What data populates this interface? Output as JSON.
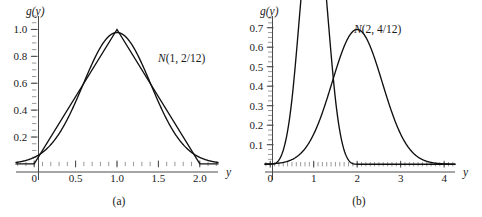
{
  "figure": {
    "background_color": "#ffffff",
    "ink_color": "#101010",
    "axis_color": "#4a4a4a",
    "panels": [
      "a",
      "b"
    ]
  },
  "chart_data": [
    {
      "type": "line",
      "panel": "a",
      "caption": "(a)",
      "title": "",
      "xlabel": "y",
      "ylabel": "g(y)",
      "grid": false,
      "legend": "none",
      "xlim": [
        -0.22,
        2.22
      ],
      "ylim": [
        -0.06,
        1.1
      ],
      "xticks": [
        0,
        0.5,
        1.0,
        1.5,
        2.0
      ],
      "xtick_labels": [
        "0",
        "0.5",
        "1.0",
        "1.5",
        "2.0"
      ],
      "yticks": [
        0.2,
        0.4,
        0.6,
        0.8,
        1.0
      ],
      "ytick_labels": [
        "0.2",
        "0.4",
        "0.6",
        "0.8",
        "1.0"
      ],
      "x_minor_tick_step": 0.1,
      "y_minor_tick_step": 0.05,
      "annotations": [
        {
          "text": "N(1, 2/12)",
          "italic_prefix": "N",
          "rest": "(1, 2/12)",
          "x": 1.47,
          "y": 0.83
        }
      ],
      "series": [
        {
          "name": "triangular density g(y)",
          "kind": "piecewise-linear",
          "x": [
            -0.22,
            0.0,
            1.0,
            2.0,
            2.22
          ],
          "values": [
            0.0,
            0.0,
            1.0,
            0.0,
            0.0
          ]
        },
        {
          "name": "N(1, 2/12) normal approximation",
          "kind": "normal",
          "mean": 1.0,
          "variance": 0.1666666667,
          "peak": 0.9772,
          "x": [
            -0.22,
            -0.1,
            0.0,
            0.1,
            0.2,
            0.3,
            0.4,
            0.5,
            0.6,
            0.7,
            0.8,
            0.9,
            1.0,
            1.1,
            1.2,
            1.3,
            1.4,
            1.5,
            1.6,
            1.7,
            1.8,
            1.9,
            2.0,
            2.1,
            2.22
          ],
          "values": [
            0.015,
            0.037,
            0.081,
            0.158,
            0.275,
            0.429,
            0.601,
            0.759,
            0.878,
            0.951,
            0.977,
            0.951,
            0.878,
            0.759,
            0.601,
            0.429,
            0.275,
            0.158,
            0.081,
            0.037,
            0.015,
            0.006,
            0.002,
            0.001,
            0.0
          ]
        }
      ]
    },
    {
      "type": "line",
      "panel": "b",
      "caption": "(b)",
      "title": "",
      "xlabel": "y",
      "ylabel": "g(y)",
      "grid": false,
      "legend": "none",
      "xlim": [
        -0.12,
        4.25
      ],
      "ylim": [
        -0.04,
        0.76
      ],
      "xticks": [
        0,
        1,
        2,
        3,
        4
      ],
      "xtick_labels": [
        "0",
        "1",
        "2",
        "3",
        "4"
      ],
      "yticks": [
        0.1,
        0.2,
        0.3,
        0.4,
        0.5,
        0.6,
        0.7
      ],
      "ytick_labels": [
        "0.1",
        "0.2",
        "0.3",
        "0.4",
        "0.5",
        "0.6",
        "0.7"
      ],
      "x_minor_tick_step": 0.1,
      "y_minor_tick_step": 0.025,
      "annotations": [
        {
          "text": "N(2, 4/12)",
          "italic_prefix": "N",
          "rest": "(2, 4/12)",
          "x": 2.55,
          "y": 0.695
        }
      ],
      "series": [
        {
          "name": "sum-of-four-uniforms density g(y)",
          "kind": "irwin-hall",
          "peak": 0.6905,
          "x": [
            0.0,
            0.2,
            0.4,
            0.6,
            0.8,
            1.0,
            1.2,
            1.4,
            1.6,
            1.8,
            2.0,
            2.2,
            2.4,
            2.6,
            2.8,
            3.0,
            3.2,
            3.4,
            3.6,
            3.8,
            4.0
          ],
          "values": [
            0.0,
            0.0013,
            0.0107,
            0.036,
            0.0853,
            0.1667,
            0.2827,
            0.4133,
            0.5387,
            0.6347,
            0.6905,
            0.6347,
            0.5387,
            0.4133,
            0.2827,
            0.1667,
            0.0853,
            0.036,
            0.0107,
            0.0013,
            0.0
          ]
        },
        {
          "name": "N(2, 4/12) normal approximation",
          "kind": "normal",
          "mean": 2.0,
          "variance": 0.3333333333,
          "peak": 0.6647,
          "x": [
            -0.12,
            0.0,
            0.2,
            0.4,
            0.6,
            0.8,
            1.0,
            1.2,
            1.4,
            1.6,
            1.8,
            2.0,
            2.2,
            2.4,
            2.6,
            2.8,
            3.0,
            3.2,
            3.4,
            3.6,
            3.8,
            4.0,
            4.25
          ],
          "values": [
            0.0,
            0.0019,
            0.0069,
            0.0216,
            0.0583,
            0.1354,
            0.2713,
            0.4688,
            0.6988,
            0.8994,
            0.9982,
            0.6647,
            0.6014,
            0.4466,
            0.2713,
            0.1354,
            0.0583,
            0.0216,
            0.0069,
            0.0019,
            0.0004,
            0.0001,
            0.0
          ]
        }
      ]
    }
  ],
  "panel_a": {
    "caption": "(a)",
    "y_axis_label": "g(y)",
    "x_axis_label": "y",
    "annotation_italic": "N",
    "annotation_rest": "(1, 2/12)",
    "ytick_labels": [
      "1.0",
      "0.8",
      "0.6",
      "0.4",
      "0.2"
    ],
    "xtick_labels": [
      "0",
      "0.5",
      "1.0",
      "1.5",
      "2.0"
    ]
  },
  "panel_b": {
    "caption": "(b)",
    "y_axis_label": "g(y)",
    "x_axis_label": "y",
    "annotation_italic": "N",
    "annotation_rest": "(2, 4/12)",
    "ytick_labels": [
      "0.7",
      "0.6",
      "0.5",
      "0.4",
      "0.3",
      "0.2",
      "0.1"
    ],
    "xtick_labels": [
      "0",
      "1",
      "2",
      "3",
      "4"
    ]
  }
}
